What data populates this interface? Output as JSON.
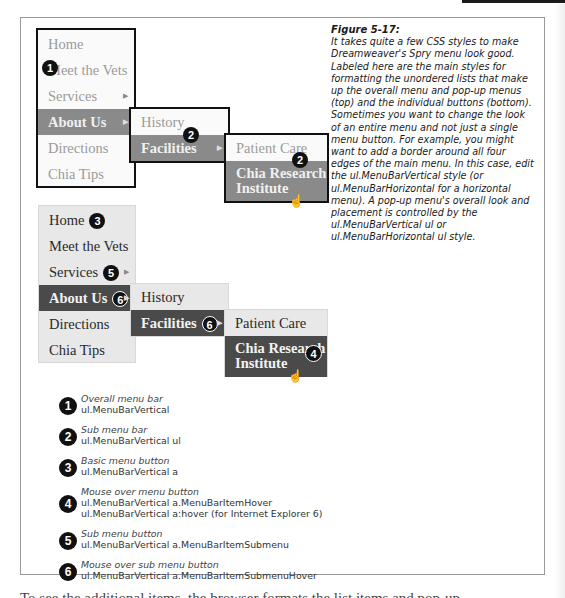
{
  "figure": {
    "title": "Figure 5-17:",
    "caption": "It takes quite a few CSS styles to make Dreamweaver's Spry menu look good. Labeled here are the main styles for formatting the unordered lists that make up the overall menu and pop-up menus (top) and the individual buttons (bottom). Sometimes you want to change the look of an entire menu and not just a single menu button. For example, you might want to add a border around all four edges of the main menu. In this case, edit the ul.MenuBarVertical style (or ul.MenuBarHorizontal for a horizontal menu). A pop-up menu's overall look and placement is controlled by the ul.MenuBarVertical ul or ul.MenuBarHorizontal ul style."
  },
  "menu": {
    "main_items": [
      "Home",
      "Meet the Vets",
      "Services",
      "About Us",
      "Directions",
      "Chia Tips"
    ],
    "sub_items": [
      "History",
      "Facilities"
    ],
    "subsub_items": [
      "Patient Care",
      "Chia Research Institute"
    ],
    "subsub_line1": "Chia Research",
    "subsub_line2": "Institute"
  },
  "badges": {
    "b1": "1",
    "b2": "2",
    "b3": "3",
    "b4": "4",
    "b5": "5",
    "b6": "6"
  },
  "legend": [
    {
      "num": "1",
      "label": "Overall menu bar",
      "selectors": [
        "ul.MenuBarVertical"
      ]
    },
    {
      "num": "2",
      "label": "Sub menu bar",
      "selectors": [
        "ul.MenuBarVertical ul"
      ]
    },
    {
      "num": "3",
      "label": "Basic menu button",
      "selectors": [
        "ul.MenuBarVertical a"
      ]
    },
    {
      "num": "4",
      "label": "Mouse over menu button",
      "selectors": [
        "ul.MenuBarVertical a.MenuBarItemHover",
        "ul.MenuBarVertical a:hover (for Internet Explorer 6)"
      ]
    },
    {
      "num": "5",
      "label": "Sub menu button",
      "selectors": [
        "ul.MenuBarVertical a.MenuBarItemSubmenu"
      ]
    },
    {
      "num": "6",
      "label": "Mouse over sub menu button",
      "selectors": [
        "ul.MenuBarVertical a.MenuBarItemSubmenuHover"
      ]
    }
  ],
  "body_text_clipped": "To see the additional items, the browser formats the list items and pop-up..."
}
